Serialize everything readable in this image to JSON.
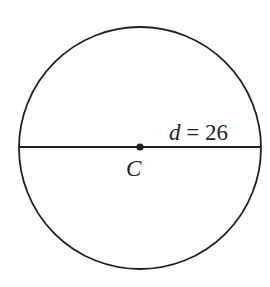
{
  "diagram": {
    "type": "circle",
    "center_label": "C",
    "diameter_label_var": "d",
    "diameter_label_eq": " = ",
    "diameter_value": "26",
    "stroke_color": "#231f20",
    "background": "#ffffff"
  }
}
